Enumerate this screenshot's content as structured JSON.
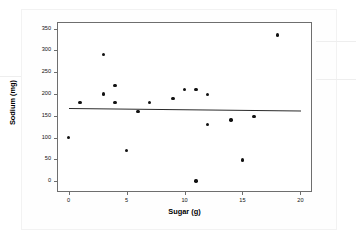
{
  "chart_data": {
    "type": "scatter",
    "title": "",
    "xlabel": "Sugar (g)",
    "ylabel": "Sodium (mg)",
    "xlim": [
      -1,
      21
    ],
    "ylim": [
      -25,
      365
    ],
    "xticks": [
      0,
      5,
      10,
      15,
      20
    ],
    "yticks": [
      0,
      50,
      100,
      150,
      200,
      250,
      300,
      350
    ],
    "xtick_labels": [
      "0",
      "5",
      "10",
      "15",
      "20"
    ],
    "ytick_labels": [
      "0",
      "50",
      "100",
      "150",
      "200",
      "250",
      "300",
      "350"
    ],
    "grid": false,
    "legend": null,
    "marker_color": "#111111",
    "fitline_color": "#2b2b2b",
    "points": [
      {
        "x": 0,
        "y": 100
      },
      {
        "x": 1,
        "y": 180
      },
      {
        "x": 3,
        "y": 290
      },
      {
        "x": 3,
        "y": 200
      },
      {
        "x": 4,
        "y": 220
      },
      {
        "x": 4,
        "y": 180
      },
      {
        "x": 5,
        "y": 70
      },
      {
        "x": 6,
        "y": 160
      },
      {
        "x": 7,
        "y": 180
      },
      {
        "x": 9,
        "y": 190
      },
      {
        "x": 10,
        "y": 210
      },
      {
        "x": 11,
        "y": 210
      },
      {
        "x": 11,
        "y": 0
      },
      {
        "x": 12,
        "y": 198
      },
      {
        "x": 12,
        "y": 130
      },
      {
        "x": 14,
        "y": 140
      },
      {
        "x": 15,
        "y": 48
      },
      {
        "x": 16,
        "y": 148
      },
      {
        "x": 18,
        "y": 335
      }
    ],
    "fit_line": {
      "x_start": 0,
      "y_start": 168,
      "x_end": 20,
      "y_end": 162
    }
  }
}
